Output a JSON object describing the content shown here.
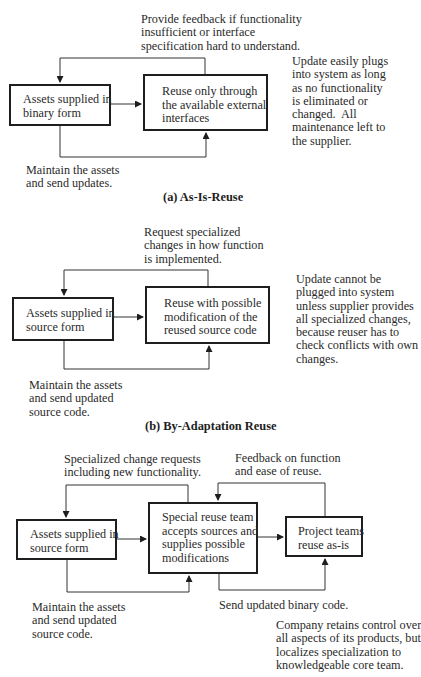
{
  "diagram": {
    "panels": [
      {
        "id": "a",
        "caption": "(a) As-Is-Reuse",
        "boxes": [
          {
            "label": "Assets supplied in\nbinary form"
          },
          {
            "label": "Reuse only through\nthe available external\ninterfaces"
          }
        ],
        "feedback_label": "Provide feedback if functionality\ninsufficient or interface\nspecification hard to understand.",
        "maintain_label": "Maintain the assets\nand send updates.",
        "note": "Update easily plugs\ninto system as long\nas no functionality\nis eliminated or\nchanged.  All\nmaintenance left to\nthe supplier."
      },
      {
        "id": "b",
        "caption": "(b) By-Adaptation Reuse",
        "boxes": [
          {
            "label": "Assets supplied in\nsource form"
          },
          {
            "label": "Reuse with possible\nmodification of the\nreused source code"
          }
        ],
        "feedback_label": "Request specialized\nchanges in how function\nis implemented.",
        "maintain_label": "Maintain the assets\nand send updated\nsource code.",
        "note": "Update cannot be\nplugged into system\nunless supplier provides\nall specialized changes,\nbecause reuser has to\ncheck conflicts with own\nchanges."
      },
      {
        "id": "c",
        "boxes": [
          {
            "label": "Assets supplied in\nsource form"
          },
          {
            "label": "Special reuse team\naccepts sources and\nsupplies possible\nmodifications"
          },
          {
            "label": "Project teams\nreuse as-is"
          }
        ],
        "feedback_label": "Specialized change requests\nincluding new functionality.",
        "feedback2_label": "Feedback on function\nand ease of reuse.",
        "maintain_label": "Maintain the assets\nand send updated\nsource code.",
        "send_label": "Send updated binary code.",
        "note": "Company retains control over\nall aspects of its products, but\nlocalizes specialization to\nknowledgeable core team."
      }
    ]
  }
}
